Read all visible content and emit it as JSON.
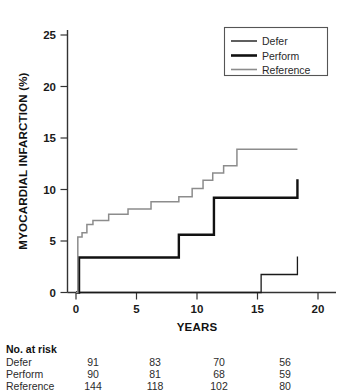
{
  "chart_data": {
    "type": "line",
    "title": "",
    "xlabel": "YEARS",
    "ylabel": "MYOCARDIAL INFARCTION (%)",
    "xlim": [
      -0.6,
      21.5
    ],
    "ylim": [
      -1.0,
      26.5
    ],
    "xticks": [
      0,
      5,
      10,
      15,
      20
    ],
    "yticks": [
      0,
      5,
      10,
      15,
      20,
      25
    ],
    "xtick_labels": [
      "0",
      "5",
      "10",
      "15",
      "20"
    ],
    "ytick_labels": [
      "0",
      "5",
      "10",
      "15",
      "20",
      "25"
    ],
    "grid": false,
    "legend_position": "upper right",
    "step": "post",
    "series": [
      {
        "name": "Defer",
        "color": "#1a1a1a",
        "linewidth": 1.3,
        "x": [
          0,
          14.4,
          15.3,
          18.3
        ],
        "y": [
          0,
          0,
          1.75,
          3.5
        ]
      },
      {
        "name": "Perform",
        "color": "#111111",
        "linewidth": 2.4,
        "x": [
          0,
          0.25,
          3.3,
          8.5,
          11.4,
          18.3
        ],
        "y": [
          0,
          3.4,
          3.4,
          5.6,
          9.2,
          11.0
        ]
      },
      {
        "name": "Reference",
        "color": "#8c8c8c",
        "linewidth": 1.5,
        "x": [
          0,
          0.15,
          0.5,
          0.9,
          1.4,
          2.1,
          2.7,
          4.3,
          6.2,
          8.5,
          9.6,
          10.5,
          11.3,
          12.2,
          13.3,
          18.3
        ],
        "y": [
          0,
          5.4,
          5.8,
          6.6,
          7.0,
          7.0,
          7.6,
          8.1,
          8.8,
          9.3,
          10.1,
          10.9,
          11.6,
          12.3,
          13.9,
          13.9
        ]
      }
    ]
  },
  "legend": {
    "items": [
      {
        "label": "Defer",
        "style": "thin-black"
      },
      {
        "label": "Perform",
        "style": "thick-black"
      },
      {
        "label": "Reference",
        "style": "gray"
      }
    ]
  },
  "risk_table": {
    "title": "No. at risk",
    "columns": [
      "0",
      "5",
      "10",
      "15"
    ],
    "rows": [
      {
        "label": "Defer",
        "values": [
          "91",
          "83",
          "70",
          "56"
        ]
      },
      {
        "label": "Perform",
        "values": [
          "90",
          "81",
          "68",
          "59"
        ]
      },
      {
        "label": "Reference",
        "values": [
          "144",
          "118",
          "102",
          "80"
        ]
      }
    ]
  }
}
